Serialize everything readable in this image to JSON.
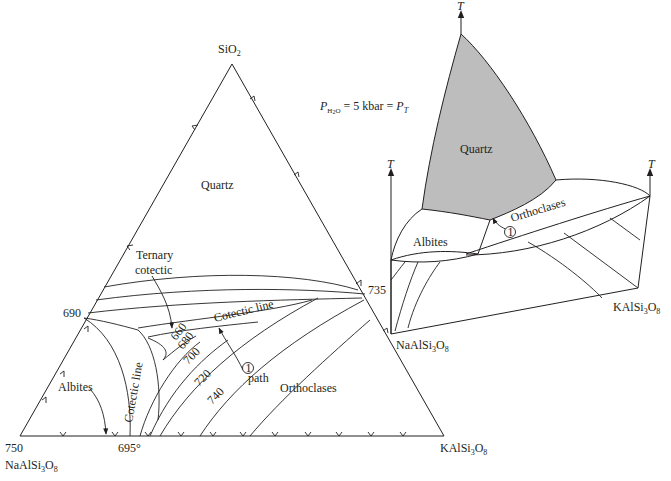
{
  "ternary": {
    "apex_top": "SiO",
    "apex_top_sub": "2",
    "apex_left": "NaAlSi",
    "apex_left_sub1": "3",
    "apex_left_mid": "O",
    "apex_left_sub2": "8",
    "apex_right": "KAlSi",
    "apex_right_sub1": "3",
    "apex_right_mid": "O",
    "apex_right_sub2": "8",
    "temp_left_corner": "750",
    "temp_left_edge": "690",
    "temp_right_edge": "735",
    "temp_base_min": "695°",
    "field_quartz": "Quartz",
    "field_albites": "Albites",
    "field_orthoclases": "Orthoclases",
    "label_ternary_1": "Ternary",
    "label_ternary_2": "cotectic",
    "label_cotectic_upper": "Cotectic line",
    "label_cotectic_lower": "Cotectic line",
    "label_path": "path",
    "path_marker": "1",
    "isotherms": [
      "660",
      "680",
      "700",
      "720",
      "740"
    ]
  },
  "pressure": {
    "P": "P",
    "sub": "H",
    "sub2": "2",
    "sub3": "O",
    "text": " = 5 kbar = ",
    "P2": "P",
    "sub_T": "T"
  },
  "block": {
    "axis_label": "T",
    "field_quartz": "Quartz",
    "field_albites": "Albites",
    "field_orthoclases": "Orthoclases",
    "path_marker": "1",
    "corner_left": "NaAlSi",
    "corner_left_sub1": "3",
    "corner_left_mid": "O",
    "corner_left_sub2": "8",
    "corner_right": "KAlSi",
    "corner_right_sub1": "3",
    "corner_right_mid": "O",
    "corner_right_sub2": "8"
  },
  "colors": {
    "quartz_fill": "#bdbdbd",
    "ink": "#231f20"
  }
}
